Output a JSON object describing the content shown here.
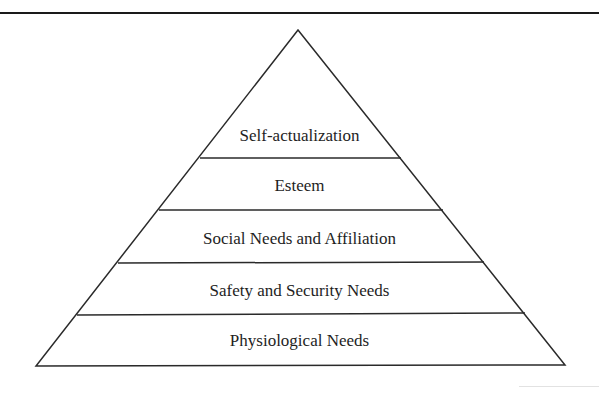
{
  "diagram": {
    "type": "pyramid",
    "colors": {
      "stroke": "#2a2a2a",
      "fill": "#ffffff",
      "text": "#1e1e1e"
    },
    "tiers": [
      {
        "label": "Self-actualization",
        "level": 5
      },
      {
        "label": "Esteem",
        "level": 4
      },
      {
        "label": "Social Needs and Affiliation",
        "level": 3
      },
      {
        "label": "Safety and Security Needs",
        "level": 2
      },
      {
        "label": "Physiological Needs",
        "level": 1
      }
    ]
  }
}
